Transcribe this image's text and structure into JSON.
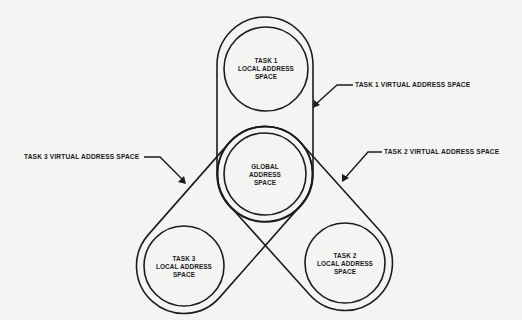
{
  "diagram": {
    "nodes": [
      {
        "id": "task1_local",
        "lines": [
          "TASK 1",
          "LOCAL ADDRESS",
          "SPACE"
        ]
      },
      {
        "id": "global",
        "lines": [
          "GLOBAL",
          "ADDRESS",
          "SPACE"
        ]
      },
      {
        "id": "task2_local",
        "lines": [
          "TASK 2",
          "LOCAL ADDRESS",
          "SPACE"
        ]
      },
      {
        "id": "task3_local",
        "lines": [
          "TASK 3",
          "LOCAL ADDRESS",
          "SPACE"
        ]
      }
    ],
    "regions": [
      {
        "id": "task1_virtual",
        "label": "TASK 1 VIRTUAL ADDRESS SPACE",
        "contains": [
          "task1_local",
          "global"
        ]
      },
      {
        "id": "task2_virtual",
        "label": "TASK 2 VIRTUAL ADDRESS SPACE",
        "contains": [
          "task2_local",
          "global"
        ]
      },
      {
        "id": "task3_virtual",
        "label": "TASK 3 VIRTUAL ADDRESS SPACE",
        "contains": [
          "task3_local",
          "global"
        ]
      }
    ]
  },
  "colors": {
    "ink": "#1c1c1c",
    "paper": "#f4f4f2"
  }
}
